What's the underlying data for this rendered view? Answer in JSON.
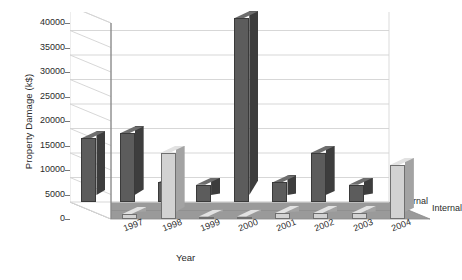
{
  "chart_data": {
    "type": "bar",
    "title": "",
    "xlabel": "Year",
    "ylabel": "Property Damage (k$)",
    "categories": [
      "1997",
      "1998",
      "1999",
      "2000",
      "2001",
      "2002",
      "2003",
      "2004"
    ],
    "series": [
      {
        "name": "External",
        "values": [
          13000,
          14000,
          4000,
          3500,
          37500,
          4000,
          10000,
          3500
        ]
      },
      {
        "name": "Internal",
        "values": [
          1000,
          13500,
          200,
          200,
          1200,
          1200,
          1200,
          11000
        ]
      }
    ],
    "ylim": [
      0,
      40000
    ],
    "yticks": [
      "0",
      "5000",
      "10000",
      "15000",
      "20000",
      "25000",
      "30000",
      "35000",
      "40000"
    ],
    "ytick_values": [
      0,
      5000,
      10000,
      15000,
      20000,
      25000,
      30000,
      35000,
      40000
    ],
    "grid": true,
    "legend_position": "right-depth-axis",
    "depth_axis_labels": [
      "External",
      "Internal"
    ],
    "colors": {
      "external_bar": "#5c5c5c",
      "internal_bar": "#d2d2d2",
      "floor": "#9a9a9a",
      "left_wall": "#ffffff",
      "gridline": "#d2d2d2",
      "text": "#2a2a2a"
    }
  }
}
